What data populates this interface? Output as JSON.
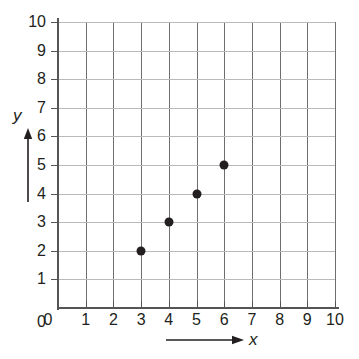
{
  "chart_data": {
    "type": "scatter",
    "title": "",
    "xlabel": "x",
    "ylabel": "y",
    "xlim": [
      0,
      10
    ],
    "ylim": [
      0,
      10
    ],
    "grid": true,
    "legend": false,
    "x_ticks": [
      "0",
      "1",
      "2",
      "3",
      "4",
      "5",
      "6",
      "7",
      "8",
      "9",
      "10"
    ],
    "y_ticks": [
      "0",
      "1",
      "2",
      "3",
      "4",
      "5",
      "6",
      "7",
      "8",
      "9",
      "10"
    ],
    "points": [
      {
        "x": 3,
        "y": 2
      },
      {
        "x": 4,
        "y": 3
      },
      {
        "x": 5,
        "y": 4
      },
      {
        "x": 6,
        "y": 5
      }
    ],
    "series": [
      {
        "name": "",
        "x": [
          3,
          4,
          5,
          6
        ],
        "values": [
          2,
          3,
          4,
          5
        ]
      }
    ]
  },
  "style": {
    "point_color": "#231f20",
    "grid_vertical_color": "#6f6f6f",
    "grid_horizontal_color": "#b9b9b9",
    "axis_color": "#555555",
    "text_color": "#231f20",
    "background": "#ffffff"
  }
}
